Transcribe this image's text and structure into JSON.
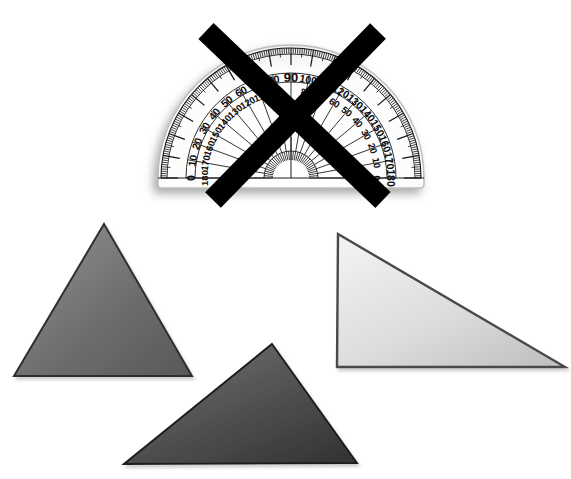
{
  "canvas": {
    "width": 571,
    "height": 479,
    "background": "#ffffff",
    "title": "Protractor crossed out above three gray triangles"
  },
  "protractor": {
    "name": "protractor",
    "center_x": 291,
    "center_y": 178,
    "outer_radius": 133,
    "inner_radius": 96,
    "hub_radius": 27,
    "body_color": "#fdfdfd",
    "edge_color": "#b9b9b9",
    "mark_color": "#111111",
    "shadow_color": "#c9c9c9",
    "outer_scale_labels": [
      "0",
      "10",
      "20",
      "30",
      "40",
      "50",
      "60",
      "70",
      "80",
      "90",
      "100",
      "110",
      "120",
      "130",
      "140",
      "150",
      "160",
      "170",
      "180"
    ],
    "inner_scale_labels": [
      "180",
      "170",
      "160",
      "150",
      "140",
      "130",
      "120",
      "110",
      "100",
      "90",
      "80",
      "70",
      "60",
      "50",
      "40",
      "30",
      "20",
      "10",
      "0"
    ],
    "highlighted_label": "90",
    "left_base_label_outer": "0",
    "left_base_label_inner": "180",
    "right_base_label_outer": "180",
    "right_base_label_inner": "0",
    "major_tick_step_degrees": 10,
    "minor_tick_step_degrees": 1
  },
  "cross_out": {
    "name": "cross-out-x-mark",
    "color": "#000000",
    "stroke_width": 22,
    "stroke_1": {
      "x1": 206,
      "y1": 31,
      "x2": 383,
      "y2": 200
    },
    "stroke_2": {
      "x1": 378,
      "y1": 31,
      "x2": 213,
      "y2": 200
    }
  },
  "shapes": [
    {
      "name": "triangle-upper-left",
      "label": "isosceles triangle",
      "points": "104,224 192,376 14,376",
      "fill_start": "#8c8c8c",
      "fill_end": "#5d5d5d",
      "stroke": "#2f2f2f",
      "gradient_angle": 125
    },
    {
      "name": "triangle-right",
      "label": "right triangle",
      "points": "338,234 565,367 337,367",
      "fill_start": "#f2f2f2",
      "fill_end": "#c6c6c6",
      "stroke": "#4a4a4a",
      "gradient_angle": 160
    },
    {
      "name": "triangle-bottom",
      "label": "scalene triangle",
      "points": "272,344 357,463 124,464",
      "fill_start": "#6f6f6f",
      "fill_end": "#3a3a3a",
      "stroke": "#1e1e1e",
      "gradient_angle": 115
    }
  ]
}
